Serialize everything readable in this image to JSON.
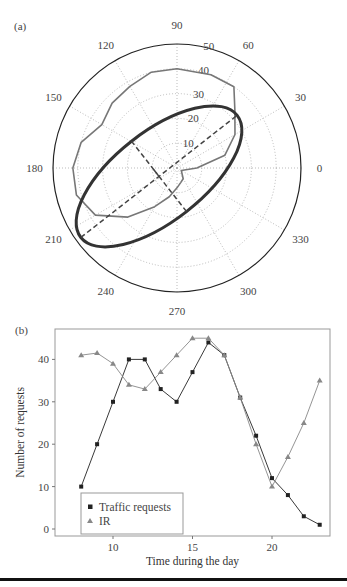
{
  "panels": {
    "a": {
      "label": "(a)"
    },
    "b": {
      "label": "(b)"
    }
  },
  "colors": {
    "data_polygon": "#777777",
    "fit_ellipse": "#333333",
    "axes_dashed": "#444444",
    "grid": "#aaaaaa",
    "traffic_series": "#222222",
    "ir_series": "#888888",
    "frame": "#999999"
  },
  "chart_data": [
    {
      "type": "polar",
      "panel": "(a)",
      "title": "",
      "angular_ticks": [
        "0",
        "30",
        "60",
        "90",
        "120",
        "150",
        "180",
        "210",
        "240",
        "270",
        "300",
        "330"
      ],
      "radial_ticks": [
        "10",
        "20",
        "30",
        "40",
        "50"
      ],
      "rlim": [
        0,
        50
      ],
      "grid": true,
      "series": [
        {
          "name": "Traffic requests (polar)",
          "style": "thin gray polygon",
          "points": [
            {
              "theta": 0,
              "r": 8
            },
            {
              "theta": 15,
              "r": 20
            },
            {
              "theta": 30,
              "r": 27
            },
            {
              "theta": 45,
              "r": 33
            },
            {
              "theta": 55,
              "r": 40
            },
            {
              "theta": 70,
              "r": 40
            },
            {
              "theta": 90,
              "r": 40
            },
            {
              "theta": 105,
              "r": 40
            },
            {
              "theta": 120,
              "r": 38
            },
            {
              "theta": 135,
              "r": 37
            },
            {
              "theta": 150,
              "r": 35
            },
            {
              "theta": 165,
              "r": 40
            },
            {
              "theta": 180,
              "r": 42
            },
            {
              "theta": 195,
              "r": 42
            },
            {
              "theta": 210,
              "r": 38
            },
            {
              "theta": 225,
              "r": 28
            },
            {
              "theta": 240,
              "r": 18
            },
            {
              "theta": 255,
              "r": 12
            },
            {
              "theta": 270,
              "r": 8
            },
            {
              "theta": 285,
              "r": 6
            },
            {
              "theta": 300,
              "r": 5
            },
            {
              "theta": 330,
              "r": 2
            }
          ]
        },
        {
          "name": "Fitted ellipse",
          "style": "thick dark ellipse",
          "center_r": 8,
          "center_theta": 205,
          "major_axis_deg": 38,
          "semi_major": 40,
          "semi_minor": 18
        },
        {
          "name": "Ellipse axes",
          "style": "dashed lines (major & minor axis)"
        }
      ]
    },
    {
      "type": "line",
      "panel": "(b)",
      "title": "",
      "xlabel": "Time during the day",
      "ylabel": "Number of requests",
      "xlim": [
        7,
        23.8
      ],
      "ylim": [
        -2,
        47
      ],
      "xticks": [
        10,
        15,
        20
      ],
      "yticks": [
        0,
        10,
        20,
        30,
        40
      ],
      "grid": false,
      "legend_position": "lower left",
      "x": [
        8,
        9,
        10,
        11,
        12,
        13,
        14,
        15,
        16,
        17,
        18,
        19,
        20,
        21,
        22,
        23
      ],
      "series": [
        {
          "name": "Traffic requests",
          "marker": "square",
          "values": [
            10,
            20,
            30,
            40,
            40,
            33,
            30,
            37,
            44,
            41,
            31,
            22,
            12,
            8,
            3,
            1
          ]
        },
        {
          "name": "IR",
          "marker": "triangle",
          "values": [
            41,
            41.5,
            39,
            34,
            33,
            37,
            41,
            45,
            45,
            41,
            31,
            20,
            10,
            17,
            25,
            35
          ]
        }
      ]
    }
  ]
}
